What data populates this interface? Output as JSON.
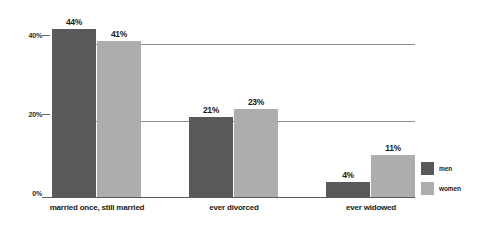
{
  "chart_data": {
    "type": "bar",
    "title": "",
    "subtitle": "",
    "xlabel": "",
    "ylabel": "",
    "categories": [
      "married once, still married",
      "ever divorced",
      "ever widowed"
    ],
    "series": [
      {
        "name": "men",
        "color": "#595959",
        "values": [
          44,
          21,
          4
        ],
        "labels": [
          "44%",
          "21%",
          "4%"
        ]
      },
      {
        "name": "women",
        "color": "#adadad",
        "values": [
          41,
          23,
          11
        ],
        "labels": [
          "41%",
          "23%",
          "11%"
        ]
      }
    ],
    "ylim": [
      0,
      48
    ],
    "yticks": [
      0,
      20,
      40
    ],
    "ytick_labels": [
      "0%",
      "20%",
      "40%"
    ],
    "gridlines": [
      20,
      40
    ],
    "grid": true,
    "legend_position": "right",
    "background": "#ffffff"
  },
  "legend": {
    "items": [
      {
        "label": "men",
        "color": "#595959"
      },
      {
        "label": "women",
        "color": "#adadad"
      }
    ]
  }
}
